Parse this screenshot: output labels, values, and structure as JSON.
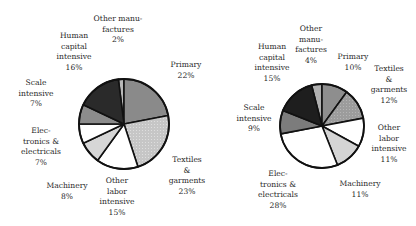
{
  "chart_data": [
    {
      "type": "pie",
      "title": "",
      "start_offset_pct": -2,
      "center": [
        124,
        124
      ],
      "radius": 45,
      "slices": [
        {
          "label": "Other manu-\nfactures\n2%",
          "name": "Other manufactures",
          "value": 2,
          "color": "#b8b8b8",
          "label_pos": [
            118,
            14
          ]
        },
        {
          "label": "Primary\n22%",
          "name": "Primary",
          "value": 22,
          "color": "#8a8a8a",
          "label_pos": [
            186,
            60
          ]
        },
        {
          "label": "Textiles\n&\ngarments\n23%",
          "name": "Textiles & garments",
          "value": 23,
          "color": "#c4c4c4",
          "label_pos": [
            187,
            155
          ]
        },
        {
          "label": "Other\nlabor\nintensive\n15%",
          "name": "Other labor intensive",
          "value": 15,
          "color": "#ffffff",
          "label_pos": [
            117,
            176
          ]
        },
        {
          "label": "Machinery\n8%",
          "name": "Machinery",
          "value": 8,
          "color": "#d6d6d6",
          "label_pos": [
            67,
            181
          ]
        },
        {
          "label": "Elec-\ntronics &\nelectricals\n7%",
          "name": "Electronics & electricals",
          "value": 7,
          "color": "#ffffff",
          "label_pos": [
            41,
            126
          ]
        },
        {
          "label": "Scale\nintensive\n7%",
          "name": "Scale intensive",
          "value": 7,
          "color": "#8c8c8c",
          "label_pos": [
            36,
            78
          ]
        },
        {
          "label": "Human\ncapital\nintensive\n16%",
          "name": "Human capital intensive",
          "value": 16,
          "color": "#2a2a2a",
          "label_pos": [
            74,
            31
          ]
        }
      ]
    },
    {
      "type": "pie",
      "title": "",
      "start_offset_pct": -4,
      "center": [
        322,
        126
      ],
      "radius": 42,
      "slices": [
        {
          "label": "Other\nmanu-\nfactures\n4%",
          "name": "Other manufactures",
          "value": 4,
          "color": "#b0b0b0",
          "label_pos": [
            311,
            24
          ]
        },
        {
          "label": "Primary\n10%",
          "name": "Primary",
          "value": 10,
          "color": "#8e8e8e",
          "label_pos": [
            353,
            52
          ]
        },
        {
          "label": "Textiles\n&\ngarments\n12%",
          "name": "Textiles & garments",
          "value": 12,
          "color": "#9a9a9a",
          "label_pos": [
            389,
            64
          ]
        },
        {
          "label": "Other\nlabor\nintensive\n11%",
          "name": "Other labor intensive",
          "value": 11,
          "color": "#ffffff",
          "label_pos": [
            389,
            123
          ]
        },
        {
          "label": "Machinery\n11%",
          "name": "Machinery",
          "value": 11,
          "color": "#d4d4d4",
          "label_pos": [
            360,
            179
          ]
        },
        {
          "label": "Elec-\ntronics &\nelectricals\n28%",
          "name": "Electronics & electricals",
          "value": 28,
          "color": "#ffffff",
          "label_pos": [
            278,
            169
          ]
        },
        {
          "label": "Scale\nintensive\n9%",
          "name": "Scale intensive",
          "value": 9,
          "color": "#7c7c7c",
          "label_pos": [
            254,
            103
          ]
        },
        {
          "label": "Human\ncapital\nintensive\n15%",
          "name": "Human capital intensive",
          "value": 15,
          "color": "#1e1e1e",
          "label_pos": [
            272,
            42
          ]
        }
      ]
    }
  ]
}
